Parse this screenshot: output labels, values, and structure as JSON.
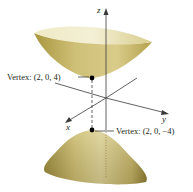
{
  "figure": {
    "type": "hyperboloid of two sheets",
    "axes": {
      "x": "x",
      "y": "y",
      "z": "z"
    },
    "vertices": [
      {
        "label": "Vertex: (2, 0, 4)",
        "point": [
          2,
          0,
          4
        ],
        "sheet": "upper"
      },
      {
        "label": "Vertex: (2, 0, −4)",
        "point": [
          2,
          0,
          -4
        ],
        "sheet": "lower"
      }
    ],
    "colors": {
      "surface_light": "#e9e2b0",
      "surface_mid": "#cdbd6e",
      "surface_dark": "#9c8a3c",
      "axis": "#3a3a3a",
      "point": "#000000"
    }
  }
}
